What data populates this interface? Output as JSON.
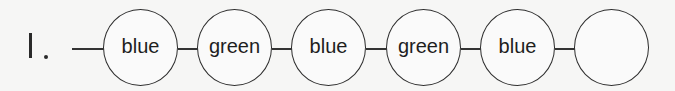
{
  "problem": {
    "number_label": "1.",
    "sequence": [
      "blue",
      "green",
      "blue",
      "green",
      "blue",
      ""
    ],
    "colors": {
      "stroke": "#2e2e2e",
      "background": "#f6f6f5"
    }
  }
}
